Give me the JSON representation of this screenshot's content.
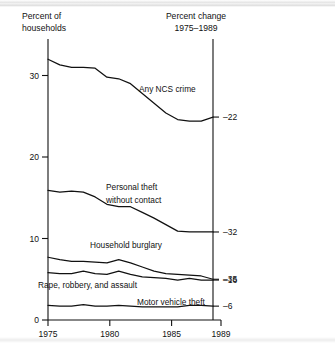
{
  "figure": {
    "left_axis_title_line1": "Percent of",
    "left_axis_title_line2": "households",
    "right_axis_title_line1": "Percent change",
    "right_axis_title_line2": "1975–1989"
  },
  "chart_data": {
    "type": "line",
    "title": "",
    "subtitle": "",
    "xlabel": "",
    "ylabel": "Percent of households",
    "xlim": [
      1975,
      1989
    ],
    "ylim": [
      0,
      33
    ],
    "yticks": [
      0,
      10,
      20,
      30
    ],
    "ytick_labels": [
      "0",
      "10",
      "20",
      "30"
    ],
    "xticks": [
      1975,
      1980,
      1985,
      1989
    ],
    "xtick_labels": [
      "1975",
      "1980",
      "1985",
      "1989"
    ],
    "grid": false,
    "legend": "inline-annotations",
    "x": [
      1975,
      1976,
      1977,
      1978,
      1979,
      1980,
      1981,
      1982,
      1983,
      1984,
      1985,
      1986,
      1987,
      1988,
      1989
    ],
    "series": [
      {
        "name": "Any NCS crime",
        "label": "Any NCS crime",
        "percent_change_1975_1989": -22,
        "percent_change_label": "–22",
        "values": [
          32.0,
          31.3,
          31.0,
          31.0,
          30.9,
          29.8,
          29.6,
          29.0,
          27.8,
          26.6,
          25.4,
          24.6,
          24.4,
          24.4,
          24.9
        ]
      },
      {
        "name": "Personal theft without contact",
        "label": "Personal theft without contact",
        "percent_change_1975_1989": -32,
        "percent_change_label": "–32",
        "values": [
          15.9,
          15.7,
          15.8,
          15.7,
          15.1,
          14.2,
          13.9,
          13.9,
          13.2,
          12.5,
          11.7,
          10.9,
          10.8,
          10.8,
          10.8
        ]
      },
      {
        "name": "Household burglary",
        "label": "Household burglary",
        "percent_change_1975_1989": -35,
        "percent_change_label": "–35",
        "values": [
          7.7,
          7.4,
          7.2,
          7.2,
          7.1,
          7.0,
          7.4,
          7.0,
          6.5,
          6.0,
          5.7,
          5.6,
          5.5,
          5.4,
          5.0
        ]
      },
      {
        "name": "Rape, robbery, and assault",
        "label": "Rape, robbery, and assault",
        "percent_change_1975_1989": -16,
        "percent_change_label": "–16",
        "values": [
          5.8,
          5.7,
          5.7,
          6.0,
          5.7,
          5.6,
          6.0,
          5.6,
          5.3,
          5.2,
          5.1,
          4.9,
          5.1,
          4.9,
          4.9
        ]
      },
      {
        "name": "Motor vehicle theft",
        "label": "Motor vehicle theft",
        "percent_change_1975_1989": -6,
        "percent_change_label": "–6",
        "values": [
          1.8,
          1.7,
          1.7,
          1.9,
          1.7,
          1.7,
          1.8,
          1.7,
          1.6,
          1.6,
          1.6,
          1.6,
          1.8,
          1.8,
          1.7
        ]
      }
    ]
  }
}
